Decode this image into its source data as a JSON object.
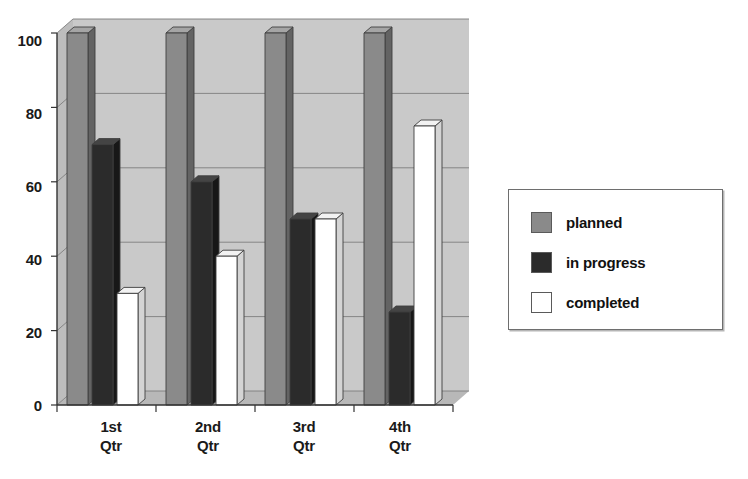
{
  "title": "",
  "chart_data": {
    "type": "bar",
    "title": "",
    "subtitle": "",
    "xlabel": "",
    "ylabel": "",
    "categories": [
      "1st Qtr",
      "2nd Qtr",
      "3rd Qtr",
      "4th Qtr"
    ],
    "category_lines": [
      [
        "1st",
        "Qtr"
      ],
      [
        "2nd",
        "Qtr"
      ],
      [
        "3rd",
        "Qtr"
      ],
      [
        "4th",
        "Qtr"
      ]
    ],
    "series": [
      {
        "name": "planned",
        "values": [
          100,
          100,
          100,
          100
        ],
        "color": "#8a8a8a"
      },
      {
        "name": "in progress",
        "values": [
          70,
          60,
          50,
          25
        ],
        "color": "#2b2b2b"
      },
      {
        "name": "completed",
        "values": [
          30,
          40,
          50,
          75
        ],
        "color": "#ffffff"
      }
    ],
    "ylim": [
      0,
      100
    ],
    "yticks": [
      "0",
      "20",
      "40",
      "60",
      "80",
      "100"
    ],
    "ytick_values": [
      0,
      20,
      40,
      60,
      80,
      100
    ],
    "grid": true,
    "grid_axis": "y",
    "legend_position": "right",
    "style": "3d-clustered-column",
    "plot_background": "#c9c9c9"
  },
  "legend": {
    "items": [
      {
        "label": "planned",
        "swatch_color": "#8a8a8a"
      },
      {
        "label": "in progress",
        "swatch_color": "#2b2b2b"
      },
      {
        "label": "completed",
        "swatch_color": "#ffffff"
      }
    ]
  },
  "colors": {
    "plot_wall": "#c9c9c9",
    "plot_wall_shadow": "#bdbdbd",
    "floor": "#b8b8b8",
    "gridline": "#7e7e7e",
    "axis": "#333333",
    "planned_front": "#8a8a8a",
    "planned_side": "#636363",
    "planned_top": "#a5a5a5",
    "progress_front": "#2b2b2b",
    "progress_side": "#171717",
    "progress_top": "#444444",
    "completed_front": "#ffffff",
    "completed_side": "#d4d4d4",
    "completed_top": "#f2f2f2",
    "text": "#111111"
  }
}
